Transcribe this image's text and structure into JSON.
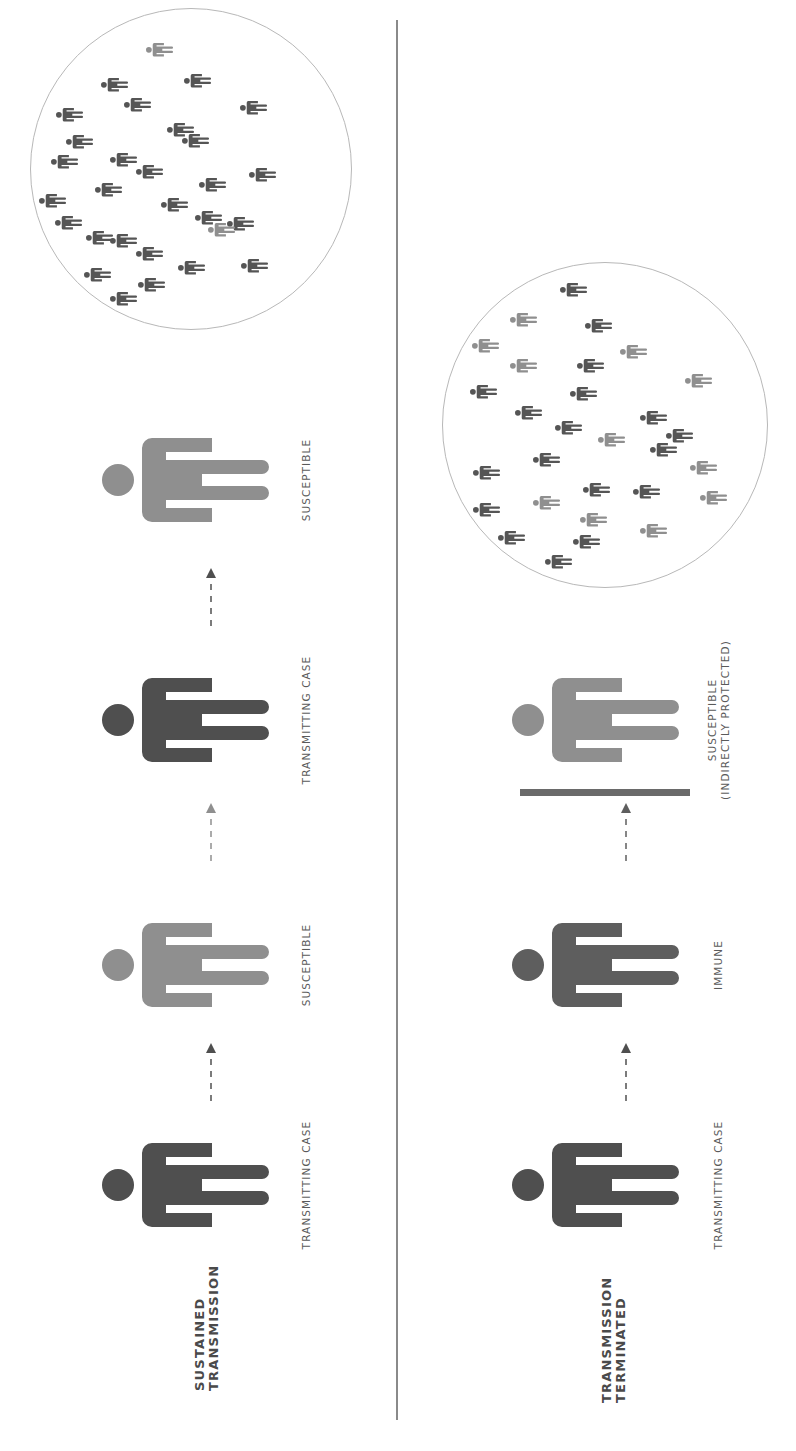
{
  "colors": {
    "transmitting": "#4f4f4f",
    "susceptible": "#8f8f8f",
    "immune": "#5e5e5e",
    "protected": "#8f8f8f",
    "crowd_dark": "#555555",
    "crowd_light": "#8f8f8f",
    "arrow_dark": "#4f4f4f",
    "arrow_light": "#8f8f8f",
    "divider": "#8a8a8a",
    "circle_border": "#b8b8b8"
  },
  "scenarios": [
    {
      "title_line1": "SUSTAINED",
      "title_line2": "TRANSMISSION",
      "chain": [
        {
          "label": "TRANSMITTING CASE",
          "status": "transmitting"
        },
        {
          "label": "SUSCEPTIBLE",
          "status": "susceptible"
        },
        {
          "label": "TRANSMITTING CASE",
          "status": "transmitting"
        },
        {
          "label": "SUSCEPTIBLE",
          "status": "susceptible"
        }
      ],
      "population": {
        "dark_count": 27,
        "light_count": 2
      }
    },
    {
      "title_line1": "TRANSMISSION",
      "title_line2": "TERMINATED",
      "chain": [
        {
          "label": "TRANSMITTING CASE",
          "status": "transmitting"
        },
        {
          "label": "IMMUNE",
          "status": "immune"
        },
        {
          "label_line1": "SUSCEPTIBLE",
          "label_line2": "(INDIRECTLY PROTECTED)",
          "status": "protected"
        }
      ],
      "population": {
        "dark_count": 19,
        "light_count": 10
      }
    }
  ]
}
